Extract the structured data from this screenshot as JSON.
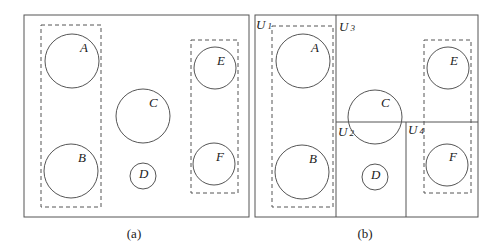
{
  "panels": [
    {
      "caption": "(a)",
      "circles": [
        {
          "label": "A"
        },
        {
          "label": "B"
        },
        {
          "label": "C"
        },
        {
          "label": "D"
        },
        {
          "label": "E"
        },
        {
          "label": "F"
        }
      ]
    },
    {
      "caption": "(b)",
      "circles": [
        {
          "label": "A"
        },
        {
          "label": "B"
        },
        {
          "label": "C"
        },
        {
          "label": "D"
        },
        {
          "label": "E"
        },
        {
          "label": "F"
        }
      ],
      "regions": [
        {
          "base": "U",
          "sub": "1"
        },
        {
          "base": "U",
          "sub": "2"
        },
        {
          "base": "U",
          "sub": "3"
        },
        {
          "base": "U",
          "sub": "4"
        }
      ]
    }
  ]
}
